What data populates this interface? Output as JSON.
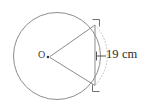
{
  "figure": {
    "type": "geometry-diagram",
    "background_color": "#ffffff",
    "stroke_color": "#8a8a8a",
    "text_color": "#2a2a2a",
    "center_label": "O",
    "dimension_label": "19 cm",
    "dimension_value": 19,
    "dimension_unit": "cm",
    "circle": {
      "cx": 57,
      "cy": 56,
      "r": 43.5
    },
    "center_dot": {
      "cx": 48,
      "cy": 57,
      "r": 1.2
    },
    "chord": {
      "x": 95,
      "y1": 25,
      "y2": 85
    },
    "radius_lines": [
      {
        "x1": 49,
        "y1": 57,
        "x2": 95,
        "y2": 25
      },
      {
        "x1": 49,
        "y1": 57,
        "x2": 95,
        "y2": 85
      }
    ],
    "corner_marks": [
      {
        "name": "top-right-bracket",
        "x": 95,
        "y": 25,
        "orientation": "top-right"
      },
      {
        "name": "bottom-right-bracket",
        "x": 95,
        "y": 85,
        "orientation": "bottom-right"
      }
    ],
    "leader_line": {
      "x1": 95,
      "y1": 56,
      "x2": 106,
      "y2": 56
    }
  }
}
